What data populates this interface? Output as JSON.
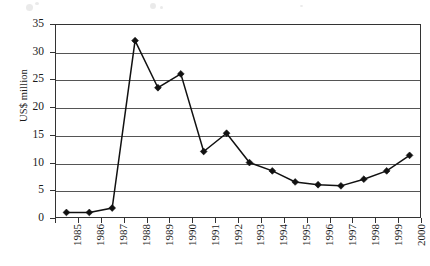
{
  "chart_data": {
    "type": "line",
    "title": "",
    "subtitle": "",
    "xlabel": "",
    "ylabel": "US$ million",
    "categories": [
      "1985",
      "1986",
      "1987",
      "1988",
      "1989",
      "1990",
      "1991",
      "1992",
      "1993",
      "1994",
      "1995",
      "1996",
      "1997",
      "1998",
      "1999",
      "2000"
    ],
    "values": [
      1.0,
      1.0,
      1.8,
      32.0,
      23.5,
      26.0,
      12.0,
      15.3,
      10.0,
      8.5,
      6.5,
      6.0,
      5.8,
      7.0,
      8.5,
      11.3
    ],
    "series": [
      {
        "name": "US$ million",
        "values": [
          1.0,
          1.0,
          1.8,
          32.0,
          23.5,
          26.0,
          12.0,
          15.3,
          10.0,
          8.5,
          6.5,
          6.0,
          5.8,
          7.0,
          8.5,
          11.3
        ]
      }
    ],
    "ylim": [
      0,
      35
    ],
    "yticks": [
      0,
      5,
      10,
      15,
      20,
      25,
      30,
      35
    ],
    "ytick_labels": [
      "0",
      "5",
      "10",
      "15",
      "20",
      "25",
      "30",
      "35"
    ],
    "grid": "horizontal",
    "legend": "none",
    "marker": "diamond",
    "line_color": "#111111",
    "grid_color": "#555555",
    "axis_color": "#333333",
    "background": "#ffffff"
  }
}
